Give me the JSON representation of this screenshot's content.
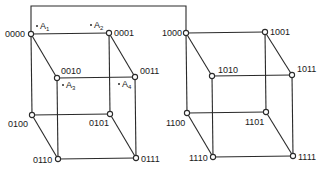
{
  "diagram": {
    "type": "two 3-cubes forming a 4-cube (binary hypercube)",
    "connector": {
      "label": "",
      "from": "0000",
      "to": "1000"
    },
    "cubes": [
      {
        "name": "left-cube",
        "nodes": [
          {
            "id": "0000",
            "label": "0000",
            "x": 31,
            "y": 34
          },
          {
            "id": "0001",
            "label": "0001",
            "x": 109,
            "y": 33
          },
          {
            "id": "0010",
            "label": "0010",
            "x": 57,
            "y": 78
          },
          {
            "id": "0011",
            "label": "0011",
            "x": 135,
            "y": 77
          },
          {
            "id": "0100",
            "label": "0100",
            "x": 32,
            "y": 115
          },
          {
            "id": "0101",
            "label": "0101",
            "x": 110,
            "y": 114
          },
          {
            "id": "0110",
            "label": "0110",
            "x": 58,
            "y": 159
          },
          {
            "id": "0111",
            "label": "0111",
            "x": 136,
            "y": 158
          }
        ]
      },
      {
        "name": "right-cube",
        "nodes": [
          {
            "id": "1000",
            "label": "1000",
            "x": 186,
            "y": 33
          },
          {
            "id": "1001",
            "label": "1001",
            "x": 265,
            "y": 32
          },
          {
            "id": "1010",
            "label": "1010",
            "x": 212,
            "y": 76
          },
          {
            "id": "1011",
            "label": "1011",
            "x": 292,
            "y": 75
          },
          {
            "id": "1100",
            "label": "1100",
            "x": 187,
            "y": 113
          },
          {
            "id": "1101",
            "label": "1101",
            "x": 266,
            "y": 112
          },
          {
            "id": "1110",
            "label": "1110",
            "x": 213,
            "y": 157
          },
          {
            "id": "1111",
            "label": "1111",
            "x": 293,
            "y": 156
          }
        ]
      }
    ],
    "annotations": [
      {
        "label": "A",
        "sub": "1",
        "near": "0000"
      },
      {
        "label": "A",
        "sub": "2",
        "near": "0001"
      },
      {
        "label": "A",
        "sub": "3",
        "near": "0010"
      },
      {
        "label": "A",
        "sub": "4",
        "near": "0011"
      }
    ]
  }
}
